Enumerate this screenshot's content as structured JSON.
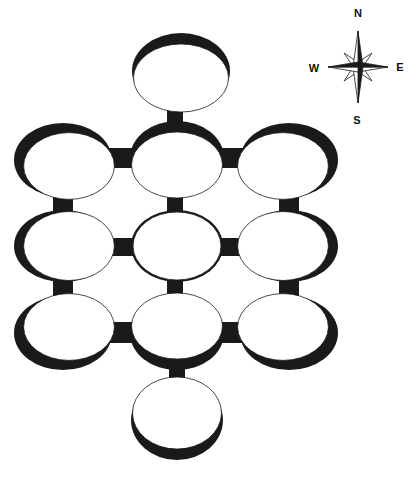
{
  "diagram": {
    "colors": {
      "ink": "#1a1a1a",
      "fill": "#ffffff",
      "background": "#ffffff"
    },
    "rooms": [
      {
        "id": "top",
        "cx": 181,
        "cy": 71,
        "rx": 49,
        "ry": 38,
        "shadow": "top"
      },
      {
        "id": "row1-left",
        "cx": 63,
        "cy": 160,
        "rx": 49,
        "ry": 37,
        "shadow": "top-left"
      },
      {
        "id": "row1-center",
        "cx": 177,
        "cy": 158,
        "rx": 47,
        "ry": 37,
        "shadow": "top"
      },
      {
        "id": "row1-right",
        "cx": 289,
        "cy": 160,
        "rx": 49,
        "ry": 37,
        "shadow": "top-right"
      },
      {
        "id": "row2-left",
        "cx": 63,
        "cy": 246,
        "rx": 49,
        "ry": 36,
        "shadow": "left"
      },
      {
        "id": "row2-center",
        "cx": 177,
        "cy": 246,
        "rx": 46,
        "ry": 36,
        "shadow": "none"
      },
      {
        "id": "row2-right",
        "cx": 289,
        "cy": 246,
        "rx": 49,
        "ry": 36,
        "shadow": "right"
      },
      {
        "id": "row3-left",
        "cx": 63,
        "cy": 333,
        "rx": 49,
        "ry": 37,
        "shadow": "bottom-left"
      },
      {
        "id": "row3-center",
        "cx": 177,
        "cy": 333,
        "rx": 47,
        "ry": 37,
        "shadow": "bottom"
      },
      {
        "id": "row3-right",
        "cx": 289,
        "cy": 333,
        "rx": 49,
        "ry": 37,
        "shadow": "bottom-right"
      },
      {
        "id": "bottom",
        "cx": 177,
        "cy": 420,
        "rx": 46,
        "ry": 40,
        "shadow": "bottom"
      }
    ],
    "connectors": [
      {
        "id": "top-to-row1",
        "x": 167,
        "y": 104,
        "w": 16,
        "h": 20
      },
      {
        "id": "row1-left-center",
        "x": 106,
        "y": 148,
        "w": 28,
        "h": 20
      },
      {
        "id": "row1-center-right",
        "x": 220,
        "y": 148,
        "w": 26,
        "h": 20
      },
      {
        "id": "row1-row2-left",
        "x": 53,
        "y": 190,
        "w": 20,
        "h": 26
      },
      {
        "id": "row1-row2-center",
        "x": 167,
        "y": 190,
        "w": 16,
        "h": 26
      },
      {
        "id": "row1-row2-right",
        "x": 279,
        "y": 190,
        "w": 20,
        "h": 26
      },
      {
        "id": "row2-left-center",
        "x": 108,
        "y": 238,
        "w": 26,
        "h": 18
      },
      {
        "id": "row2-center-right",
        "x": 220,
        "y": 238,
        "w": 26,
        "h": 18
      },
      {
        "id": "row2-row3-left",
        "x": 53,
        "y": 276,
        "w": 20,
        "h": 26
      },
      {
        "id": "row2-row3-center",
        "x": 167,
        "y": 276,
        "w": 16,
        "h": 26
      },
      {
        "id": "row2-row3-right",
        "x": 279,
        "y": 276,
        "w": 20,
        "h": 26
      },
      {
        "id": "row3-left-center",
        "x": 108,
        "y": 322,
        "w": 26,
        "h": 21
      },
      {
        "id": "row3-center-right",
        "x": 220,
        "y": 322,
        "w": 26,
        "h": 21
      },
      {
        "id": "row3-to-bottom",
        "x": 169,
        "y": 364,
        "w": 16,
        "h": 22
      }
    ],
    "compass": {
      "cx": 358,
      "cy": 67,
      "labels": {
        "north": "N",
        "south": "S",
        "east": "E",
        "west": "W"
      }
    }
  }
}
